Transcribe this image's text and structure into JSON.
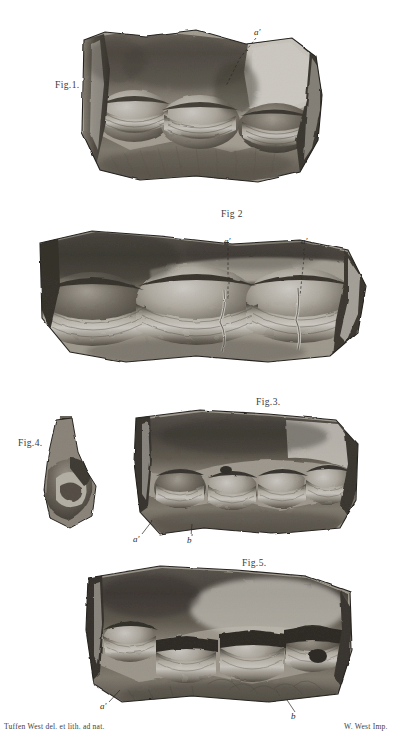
{
  "plate": {
    "title_visible": false,
    "background_color": "#ffffff",
    "ink_color": "#2b2b2b",
    "medium": "lithograph",
    "subject": "comparative anatomy — opened ruminant stomach compartments"
  },
  "figures": [
    {
      "id": "fig1",
      "label": "Fig.1.",
      "label_x": 55,
      "label_y": 80,
      "refs": [
        {
          "text": "a′",
          "x": 258,
          "y": 31,
          "leader_to_x": 224,
          "leader_to_y": 93
        }
      ]
    },
    {
      "id": "fig2",
      "label": "Fig 2",
      "label_x": 221,
      "label_y": 209,
      "refs": [
        {
          "text": "a′",
          "x": 226,
          "y": 240,
          "leader_to_x": 228,
          "leader_to_y": 300
        },
        {
          "text": "a′",
          "x": 303,
          "y": 240,
          "leader_to_x": 300,
          "leader_to_y": 296
        }
      ]
    },
    {
      "id": "fig3",
      "label": "Fig.3.",
      "label_x": 256,
      "label_y": 397,
      "refs": [
        {
          "text": "a′",
          "x": 135,
          "y": 540,
          "leader_to_x": 152,
          "leader_to_y": 521
        },
        {
          "text": "b",
          "x": 189,
          "y": 541,
          "leader_to_x": 192,
          "leader_to_y": 524
        }
      ]
    },
    {
      "id": "fig4",
      "label": "Fig.4.",
      "label_x": 18,
      "label_y": 438,
      "refs": []
    },
    {
      "id": "fig5",
      "label": "Fig.5.",
      "label_x": 242,
      "label_y": 558,
      "refs": [
        {
          "text": "a′",
          "x": 102,
          "y": 707,
          "leader_to_x": 118,
          "leader_to_y": 690
        },
        {
          "text": "b",
          "x": 293,
          "y": 717,
          "leader_to_x": 286,
          "leader_to_y": 700
        }
      ]
    }
  ],
  "credits": {
    "left": "Tuffen West del. et lith. ad nat.",
    "left_x": 4,
    "left_y": 726,
    "right": "W. West Imp.",
    "right_x": 348,
    "right_y": 726
  }
}
